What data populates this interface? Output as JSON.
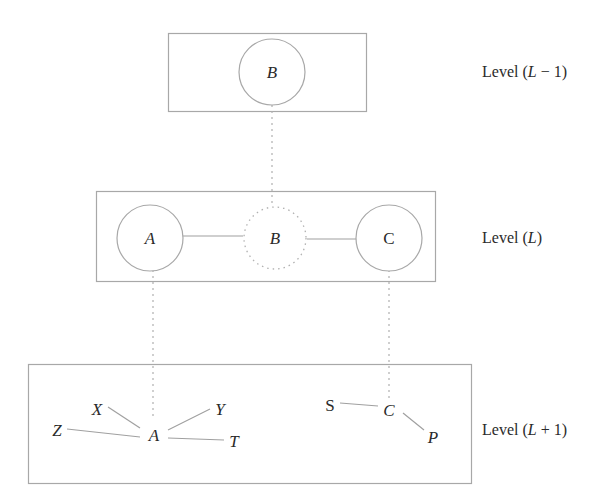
{
  "levels": [
    {
      "id": "upper",
      "label": "Level (L − 1)",
      "label_parts": [
        "Level (",
        "L",
        " − 1)"
      ]
    },
    {
      "id": "current",
      "label": "Level (L)",
      "label_parts": [
        "Level (",
        "L",
        ")"
      ]
    },
    {
      "id": "lower",
      "label": "Level (L + 1)",
      "label_parts": [
        "Level (",
        "L",
        " + 1)"
      ]
    }
  ],
  "upper_level": {
    "nodes": [
      {
        "id": "B",
        "label": "B",
        "style": "solid"
      }
    ]
  },
  "current_level": {
    "nodes": [
      {
        "id": "A",
        "label": "A",
        "style": "solid"
      },
      {
        "id": "B",
        "label": "B",
        "style": "dotted"
      },
      {
        "id": "C",
        "label": "C",
        "style": "solid"
      }
    ],
    "edges": [
      [
        "A",
        "B"
      ],
      [
        "B",
        "C"
      ]
    ]
  },
  "lower_level": {
    "nodes": [
      {
        "id": "X",
        "label": "X"
      },
      {
        "id": "Y",
        "label": "Y"
      },
      {
        "id": "Z",
        "label": "Z"
      },
      {
        "id": "A",
        "label": "A"
      },
      {
        "id": "T",
        "label": "T"
      },
      {
        "id": "S",
        "label": "S"
      },
      {
        "id": "C",
        "label": "C"
      },
      {
        "id": "P",
        "label": "P"
      }
    ],
    "edges": [
      [
        "X",
        "A"
      ],
      [
        "Y",
        "A"
      ],
      [
        "Z",
        "A"
      ],
      [
        "T",
        "A"
      ],
      [
        "S",
        "C"
      ],
      [
        "C",
        "P"
      ]
    ]
  },
  "cross_level_links": [
    {
      "from": "upper.B",
      "to": "current.B",
      "style": "dotted"
    },
    {
      "from": "current.A",
      "to": "lower.A",
      "style": "dotted"
    },
    {
      "from": "current.C",
      "to": "lower.C",
      "style": "dotted"
    }
  ]
}
